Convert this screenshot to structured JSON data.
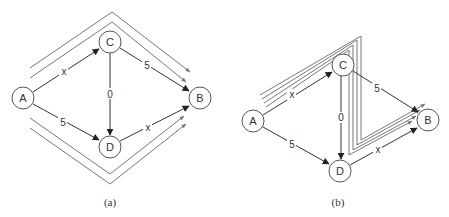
{
  "panels": [
    {
      "id": "a",
      "caption": "(a)",
      "nodes": [
        {
          "id": "A",
          "label": "A",
          "x": 23,
          "y": 98
        },
        {
          "id": "C",
          "label": "C",
          "x": 110,
          "y": 42
        },
        {
          "id": "D",
          "label": "D",
          "x": 110,
          "y": 147
        },
        {
          "id": "B",
          "label": "B",
          "x": 200,
          "y": 98
        }
      ],
      "edges": [
        {
          "from": "A",
          "to": "C",
          "label": "x"
        },
        {
          "from": "A",
          "to": "D",
          "label": "5"
        },
        {
          "from": "C",
          "to": "D",
          "label": "0"
        },
        {
          "from": "C",
          "to": "B",
          "label": "5"
        },
        {
          "from": "D",
          "to": "B",
          "label": "x"
        }
      ],
      "flow_paths": {
        "upper_count": 2,
        "lower_count": 2,
        "route_upper": "A-C-B",
        "route_lower": "A-D-B"
      }
    },
    {
      "id": "b",
      "caption": "(b)",
      "nodes": [
        {
          "id": "A",
          "label": "A",
          "x": 253,
          "y": 121
        },
        {
          "id": "C",
          "label": "C",
          "x": 343,
          "y": 65
        },
        {
          "id": "D",
          "label": "D",
          "x": 340,
          "y": 171
        },
        {
          "id": "B",
          "label": "B",
          "x": 428,
          "y": 120
        }
      ],
      "edges": [
        {
          "from": "A",
          "to": "C",
          "label": "x"
        },
        {
          "from": "A",
          "to": "D",
          "label": "5"
        },
        {
          "from": "C",
          "to": "D",
          "label": "0"
        },
        {
          "from": "C",
          "to": "B",
          "label": "5"
        },
        {
          "from": "D",
          "to": "B",
          "label": "x"
        }
      ],
      "flow_paths": {
        "count": 4,
        "route": "A-C-D-B"
      }
    }
  ],
  "colors": {
    "node_stroke": "#555555",
    "edge": "#333333",
    "flow": "#777777",
    "background": "#ffffff"
  }
}
